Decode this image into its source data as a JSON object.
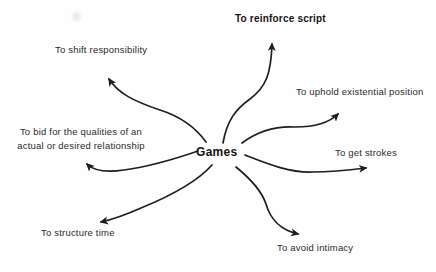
{
  "center_label": "Games",
  "branches": {
    "reinforce": {
      "label": "To reinforce script"
    },
    "shift": {
      "label": "To shift responsibility"
    },
    "uphold": {
      "label": "To uphold existential position"
    },
    "bid": {
      "line1": "To bid for the qualities of an",
      "line2": "actual or desired relationship"
    },
    "strokes": {
      "label": "To get strokes"
    },
    "structure": {
      "label": "To structure time"
    },
    "avoid": {
      "label": "To avoid intimacy"
    }
  },
  "colors": {
    "ink": "#1e1e1e",
    "background": "#fefefe"
  }
}
